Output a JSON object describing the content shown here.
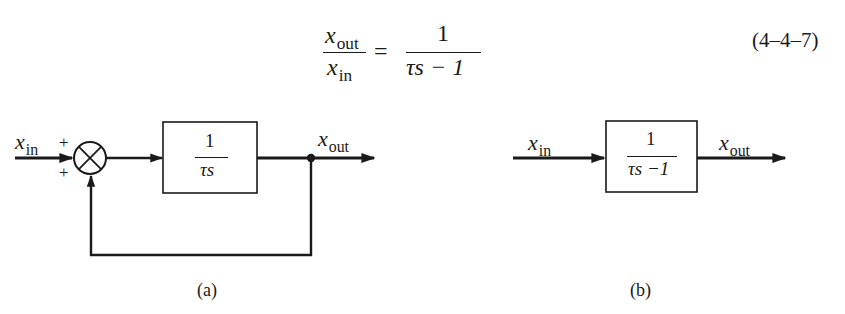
{
  "equation": {
    "lhs_numerator": {
      "var": "x",
      "sub": "out"
    },
    "lhs_denominator": {
      "var": "x",
      "sub": "in"
    },
    "equals": "=",
    "rhs_numerator": "1",
    "rhs_denominator": "τs − 1",
    "number": "(4–4–7)"
  },
  "diagram_a": {
    "input_label": {
      "var": "x",
      "sub": "in"
    },
    "sum_signs": [
      "+",
      "+"
    ],
    "block_numerator": "1",
    "block_denominator": "τs",
    "output_label": {
      "var": "x",
      "sub": "out"
    },
    "caption": "(a)"
  },
  "diagram_b": {
    "input_label": {
      "var": "x",
      "sub": "in"
    },
    "block_numerator": "1",
    "block_denominator": "τs −1",
    "output_label": {
      "var": "x",
      "sub": "out"
    },
    "caption": "(b)"
  },
  "colors": {
    "ink": "#1a1a1a",
    "background": "#ffffff"
  }
}
